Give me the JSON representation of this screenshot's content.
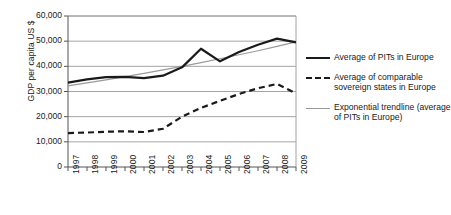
{
  "chart_data": {
    "type": "line",
    "title": "",
    "xlabel": "",
    "ylabel": "GDP per capita US $",
    "x": [
      "1997",
      "1998",
      "1999",
      "2000",
      "2001",
      "2002",
      "2003",
      "2004",
      "2005",
      "2006",
      "2007",
      "2008",
      "2009"
    ],
    "categories": [
      "1997",
      "1998",
      "1999",
      "2000",
      "2001",
      "2002",
      "2003",
      "2004",
      "2005",
      "2006",
      "2007",
      "2008",
      "2009"
    ],
    "ylim": [
      0,
      60000
    ],
    "xlim": [
      1997,
      2009
    ],
    "yticks": [
      0,
      10000,
      20000,
      30000,
      40000,
      50000,
      60000
    ],
    "ytick_labels": [
      "0",
      "10,000",
      "20,000",
      "30,000",
      "40,000",
      "50,000",
      "60,000"
    ],
    "grid": "horizontal",
    "legend_position": "right",
    "series": [
      {
        "name": "Average of PITs in Europe",
        "style": "solid",
        "color": "#1a1a1a",
        "width": 2.2,
        "values": [
          33500,
          34800,
          35700,
          35800,
          35300,
          36300,
          39600,
          47000,
          42000,
          45700,
          48600,
          51000,
          49500
        ]
      },
      {
        "name": "Average of comparable sovereign states in Europe",
        "style": "dashed",
        "color": "#1a1a1a",
        "width": 2.2,
        "values": [
          13500,
          13700,
          14000,
          14200,
          13900,
          15200,
          20000,
          23500,
          26300,
          29000,
          31300,
          33000,
          29200
        ]
      },
      {
        "name": "Exponential trendline (average of PITs in Europe)",
        "style": "thin",
        "color": "#9a9a9a",
        "width": 1.2,
        "values": [
          32200,
          33400,
          34600,
          35900,
          37200,
          38600,
          40000,
          41500,
          43000,
          44600,
          46200,
          47900,
          49700
        ]
      }
    ]
  },
  "legend": {
    "entries": [
      {
        "label": "Average of PITs in Europe",
        "style": "solid"
      },
      {
        "label": "Average of comparable sovereign states in Europe",
        "style": "dashed"
      },
      {
        "label": "Exponential trendline (average of PITs in Europe)",
        "style": "thin"
      }
    ]
  }
}
